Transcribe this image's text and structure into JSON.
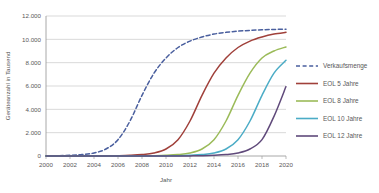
{
  "chart_data": {
    "type": "line",
    "title": "",
    "xlabel": "Jahr",
    "ylabel": "Geräteanzahl in Tausend",
    "xlim": [
      2000,
      2020
    ],
    "ylim": [
      0,
      12000
    ],
    "xticks": [
      "2000",
      "2002",
      "2004",
      "2006",
      "2008",
      "2010",
      "2012",
      "2014",
      "2016",
      "2018",
      "2020"
    ],
    "xtick_values": [
      2000,
      2002,
      2004,
      2006,
      2008,
      2010,
      2012,
      2014,
      2016,
      2018,
      2020
    ],
    "yticks": [
      "0",
      "2.000",
      "4.000",
      "6.000",
      "8.000",
      "10.000",
      "12.000"
    ],
    "ytick_values": [
      0,
      2000,
      4000,
      6000,
      8000,
      10000,
      12000
    ],
    "grid": "horizontal",
    "legend_position": "right",
    "x": [
      2000,
      2001,
      2002,
      2003,
      2004,
      2005,
      2006,
      2007,
      2008,
      2009,
      2010,
      2011,
      2012,
      2013,
      2014,
      2015,
      2016,
      2017,
      2018,
      2019,
      2020
    ],
    "series": [
      {
        "name": "Verkaufsmenge",
        "color": "#4A5F9E",
        "style": "dashed",
        "values": [
          10,
          25,
          55,
          120,
          260,
          600,
          1400,
          3000,
          5200,
          7100,
          8400,
          9300,
          9850,
          10200,
          10450,
          10600,
          10700,
          10770,
          10820,
          10850,
          10870
        ]
      },
      {
        "name": "EOL 5 Jahre",
        "color": "#A0403A",
        "style": "solid",
        "values": [
          0,
          0,
          0,
          0,
          0,
          10,
          25,
          55,
          120,
          260,
          600,
          1400,
          3000,
          5200,
          7100,
          8400,
          9300,
          9850,
          10200,
          10450,
          10600
        ]
      },
      {
        "name": "EOL 8 Jahre",
        "color": "#9BBB59",
        "style": "solid",
        "values": [
          0,
          0,
          0,
          0,
          0,
          0,
          0,
          0,
          10,
          25,
          55,
          120,
          260,
          600,
          1400,
          3000,
          5200,
          7100,
          8400,
          9000,
          9350
        ]
      },
      {
        "name": "EOL 10 Jahre",
        "color": "#4BACC6",
        "style": "solid",
        "values": [
          0,
          0,
          0,
          0,
          0,
          0,
          0,
          0,
          0,
          0,
          10,
          25,
          55,
          120,
          260,
          600,
          1400,
          3000,
          5200,
          7100,
          8200
        ]
      },
      {
        "name": "EOL 12 Jahre",
        "color": "#604A7B",
        "style": "solid",
        "values": [
          0,
          0,
          0,
          0,
          0,
          0,
          0,
          0,
          0,
          0,
          0,
          0,
          10,
          25,
          55,
          120,
          260,
          600,
          1400,
          3400,
          5950
        ]
      }
    ]
  }
}
